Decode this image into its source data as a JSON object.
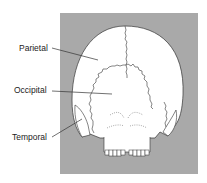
{
  "figure": {
    "labels": [
      {
        "id": "parietal",
        "text": "Parietal"
      },
      {
        "id": "occipital",
        "text": "Occipital"
      },
      {
        "id": "temporal",
        "text": "Temporal"
      }
    ],
    "colors": {
      "panel": "#a9a9a9",
      "bone": "#ffffff",
      "line": "#333333"
    }
  }
}
